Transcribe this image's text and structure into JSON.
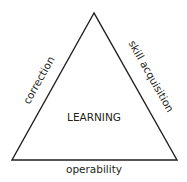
{
  "diagram": {
    "center_label": "LEARNING",
    "left_side_label": "correction",
    "right_side_label": "skill acquisition",
    "bottom_side_label": "operability",
    "colors": {
      "stroke": "#231f20",
      "text": "#231f20",
      "background": "#ffffff"
    }
  }
}
